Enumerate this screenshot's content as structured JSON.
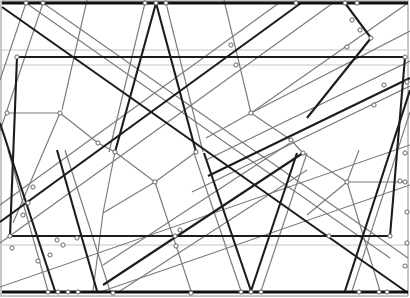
{
  "figure": {
    "type": "line-arrangement-diagram",
    "canvas": {
      "width": 410,
      "height": 298,
      "background": "#ffffff",
      "border_color": "#909090",
      "border_width": 1
    },
    "styles": {
      "frame": {
        "color": "#909090",
        "width": 1
      },
      "edge": {
        "color": "#101010",
        "width": 2.8
      },
      "thick": {
        "color": "#1c1c1c",
        "width": 2.1
      },
      "medium": {
        "color": "#7a7a7a",
        "width": 1.15
      },
      "light": {
        "color": "#c4c4c4",
        "width": 1.0
      },
      "node": {
        "radius": 2.1,
        "fill": "#ffffff",
        "stroke": "#555555",
        "stroke_width": 0.9
      }
    },
    "edge_segments": [
      [
        2,
        3,
        408,
        3
      ],
      [
        2,
        292,
        408,
        292
      ]
    ],
    "quad": [
      [
        17,
        57
      ],
      [
        405,
        57
      ],
      [
        390,
        236
      ],
      [
        10,
        236
      ]
    ],
    "thick_segments": [
      [
        156,
        3,
        115,
        152
      ],
      [
        156,
        3,
        196,
        152
      ],
      [
        251,
        291,
        204,
        153
      ],
      [
        251,
        291,
        297,
        153
      ],
      [
        0,
        222,
        301,
        3
      ],
      [
        2,
        7,
        408,
        293
      ],
      [
        208,
        176,
        410,
        78
      ],
      [
        103,
        285,
        303,
        153
      ],
      [
        0,
        123,
        55,
        291
      ],
      [
        57,
        150,
        97,
        291
      ],
      [
        345,
        3,
        371,
        38
      ],
      [
        371,
        38,
        307,
        118
      ],
      [
        410,
        90,
        345,
        291
      ]
    ],
    "medium_segments": [
      [
        26,
        3,
        390,
        258
      ],
      [
        43,
        3,
        408,
        258
      ],
      [
        0,
        205,
        279,
        3
      ],
      [
        0,
        243,
        333,
        3
      ],
      [
        26,
        3,
        0,
        80
      ],
      [
        43,
        3,
        0,
        131
      ],
      [
        87,
        0,
        62,
        110
      ],
      [
        145,
        3,
        109,
        152
      ],
      [
        166,
        3,
        203,
        152
      ],
      [
        7,
        113,
        60,
        113
      ],
      [
        60,
        113,
        13,
        223
      ],
      [
        60,
        113,
        98,
        143
      ],
      [
        98,
        143,
        115,
        152
      ],
      [
        115,
        152,
        103,
        213
      ],
      [
        103,
        213,
        93,
        291
      ],
      [
        115,
        152,
        155,
        182
      ],
      [
        196,
        152,
        155,
        182
      ],
      [
        155,
        182,
        191,
        291
      ],
      [
        155,
        182,
        103,
        213
      ],
      [
        224,
        0,
        251,
        113
      ],
      [
        251,
        113,
        410,
        31
      ],
      [
        251,
        113,
        206,
        138
      ],
      [
        251,
        113,
        291,
        140
      ],
      [
        291,
        140,
        303,
        153
      ],
      [
        303,
        153,
        347,
        182
      ],
      [
        347,
        182,
        405,
        182
      ],
      [
        347,
        182,
        359,
        150
      ],
      [
        347,
        182,
        307,
        215
      ],
      [
        347,
        182,
        380,
        291
      ],
      [
        408,
        3,
        251,
        113
      ],
      [
        241,
        291,
        194,
        153
      ],
      [
        261,
        291,
        307,
        153
      ],
      [
        103,
        265,
        290,
        143
      ],
      [
        120,
        291,
        307,
        170
      ],
      [
        192,
        192,
        410,
        86
      ],
      [
        206,
        160,
        410,
        61
      ],
      [
        0,
        287,
        410,
        145
      ],
      [
        103,
        291,
        410,
        185
      ],
      [
        410,
        112,
        352,
        291
      ],
      [
        8,
        150,
        48,
        291
      ],
      [
        65,
        150,
        110,
        291
      ]
    ],
    "light_segments": [
      [
        2,
        50,
        408,
        50
      ],
      [
        2,
        65,
        408,
        65
      ],
      [
        2,
        245,
        408,
        245
      ]
    ],
    "nodes": [
      [
        26,
        3
      ],
      [
        43,
        3
      ],
      [
        145,
        3
      ],
      [
        156,
        3
      ],
      [
        166,
        3
      ],
      [
        296,
        3
      ],
      [
        345,
        3
      ],
      [
        357,
        3
      ],
      [
        17,
        57
      ],
      [
        231,
        45
      ],
      [
        236,
        65
      ],
      [
        347,
        47
      ],
      [
        405,
        57
      ],
      [
        352,
        20
      ],
      [
        360,
        30
      ],
      [
        371,
        38
      ],
      [
        384,
        85
      ],
      [
        374,
        105
      ],
      [
        407,
        82
      ],
      [
        7,
        113
      ],
      [
        60,
        113
      ],
      [
        98,
        143
      ],
      [
        115,
        152
      ],
      [
        196,
        152
      ],
      [
        251,
        113
      ],
      [
        291,
        140
      ],
      [
        303,
        153
      ],
      [
        155,
        182
      ],
      [
        347,
        182
      ],
      [
        400,
        181
      ],
      [
        405,
        153
      ],
      [
        405,
        182
      ],
      [
        407,
        212
      ],
      [
        33,
        187
      ],
      [
        28,
        203
      ],
      [
        23,
        215
      ],
      [
        10,
        236
      ],
      [
        57,
        240
      ],
      [
        63,
        245
      ],
      [
        77,
        238
      ],
      [
        12,
        248
      ],
      [
        38,
        261
      ],
      [
        50,
        255
      ],
      [
        175,
        236
      ],
      [
        176,
        246
      ],
      [
        180,
        230
      ],
      [
        329,
        236
      ],
      [
        390,
        236
      ],
      [
        48,
        292
      ],
      [
        58,
        292
      ],
      [
        68,
        292
      ],
      [
        78,
        292
      ],
      [
        113,
        293
      ],
      [
        191,
        293
      ],
      [
        241,
        292
      ],
      [
        251,
        292
      ],
      [
        261,
        292
      ],
      [
        359,
        292
      ],
      [
        379,
        292
      ],
      [
        387,
        292
      ],
      [
        407,
        243
      ],
      [
        405,
        266
      ]
    ]
  }
}
